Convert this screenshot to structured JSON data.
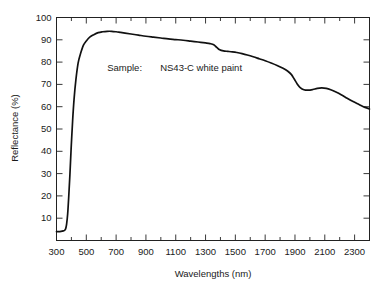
{
  "chart_data": {
    "type": "line",
    "title": "",
    "xlabel": "Wavelengths (nm)",
    "ylabel": "Reflectance (%)",
    "xlim": [
      300,
      2400
    ],
    "ylim": [
      0,
      100
    ],
    "grid": false,
    "legend": "none",
    "annotations": [
      {
        "label": "Sample:",
        "value": "NS43-C white paint",
        "x": 640,
        "y": 76
      }
    ],
    "xticks": [
      300,
      500,
      700,
      900,
      1100,
      1300,
      1500,
      1700,
      1900,
      2100,
      2300
    ],
    "xtick_labels": [
      "300",
      "500",
      "700",
      "900",
      "1100",
      "1300",
      "1500",
      "1700",
      "1900",
      "2100",
      "2300"
    ],
    "xminor_ticks": [
      400,
      600,
      800,
      1000,
      1200,
      1400,
      1600,
      1800,
      2000,
      2200,
      2400
    ],
    "yticks": [
      10,
      20,
      30,
      40,
      50,
      60,
      70,
      80,
      90,
      100
    ],
    "ytick_labels": [
      "10",
      "20",
      "30",
      "40",
      "50",
      "60",
      "70",
      "80",
      "90",
      "100"
    ],
    "series": [
      {
        "name": "NS43-C white paint",
        "color": "#111111",
        "x": [
          300,
          315,
          330,
          345,
          355,
          362,
          368,
          375,
          382,
          390,
          398,
          408,
          418,
          430,
          445,
          460,
          480,
          500,
          525,
          550,
          580,
          610,
          640,
          670,
          700,
          730,
          760,
          800,
          850,
          900,
          950,
          1000,
          1050,
          1100,
          1150,
          1200,
          1250,
          1300,
          1330,
          1355,
          1375,
          1395,
          1420,
          1450,
          1480,
          1510,
          1545,
          1580,
          1620,
          1660,
          1700,
          1740,
          1780,
          1820,
          1850,
          1875,
          1895,
          1915,
          1935,
          1960,
          1990,
          2020,
          2050,
          2080,
          2110,
          2140,
          2175,
          2210,
          2250,
          2290,
          2330,
          2370,
          2400
        ],
        "y": [
          4.0,
          4.0,
          4.1,
          4.3,
          4.6,
          5.4,
          7.5,
          12.0,
          19.5,
          29.5,
          41.0,
          53.5,
          63.5,
          72.0,
          79.5,
          83.5,
          87.5,
          89.5,
          91.3,
          92.3,
          93.2,
          93.6,
          93.8,
          93.8,
          93.6,
          93.3,
          93.0,
          92.6,
          92.1,
          91.6,
          91.2,
          90.8,
          90.4,
          90.1,
          89.8,
          89.4,
          89.0,
          88.6,
          88.3,
          87.8,
          86.6,
          85.5,
          85.0,
          84.8,
          84.6,
          84.3,
          83.8,
          83.2,
          82.4,
          81.5,
          80.6,
          79.6,
          78.5,
          77.2,
          76.0,
          74.5,
          72.4,
          70.2,
          68.6,
          67.6,
          67.4,
          67.7,
          68.2,
          68.4,
          68.2,
          67.6,
          66.6,
          65.4,
          63.8,
          62.3,
          61.0,
          59.7,
          59.0
        ]
      }
    ]
  },
  "figure": {
    "axis_color": "#222222",
    "background": "#ffffff"
  }
}
